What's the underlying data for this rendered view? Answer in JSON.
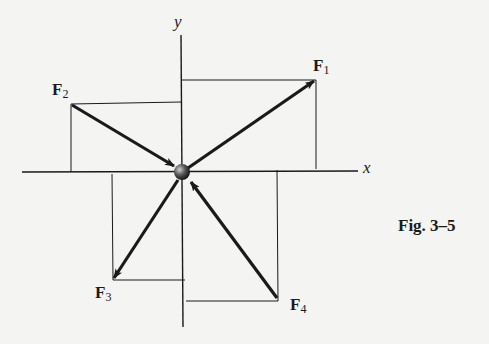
{
  "axes": {
    "x_label": "x",
    "y_label": "y"
  },
  "forces": [
    {
      "name": "F",
      "sub": "1",
      "direction": "away from particle",
      "quadrant": "I"
    },
    {
      "name": "F",
      "sub": "2",
      "direction": "toward particle",
      "quadrant": "II"
    },
    {
      "name": "F",
      "sub": "3",
      "direction": "away from particle",
      "quadrant": "III"
    },
    {
      "name": "F",
      "sub": "4",
      "direction": "toward particle",
      "quadrant": "IV"
    }
  ],
  "caption": "Fig. 3–5",
  "colors": {
    "ink": "#1a1a1a",
    "paper": "#f4f4f2"
  }
}
